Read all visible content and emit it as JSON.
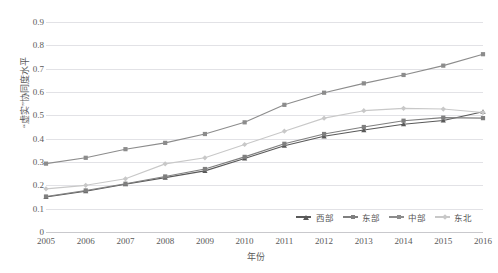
{
  "top_caption": "",
  "axes": {
    "y_title": "“虚实”协同度水平",
    "x_title": "年份",
    "y_ticks": [
      "0.9",
      "0.8",
      "0.7",
      "0.6",
      "0.5",
      "0.4",
      "0.3",
      "0.2",
      "0.1",
      "0"
    ],
    "x_ticks": [
      "2005",
      "2006",
      "2007",
      "2008",
      "2009",
      "2010",
      "2011",
      "2012",
      "2013",
      "2014",
      "2015",
      "2016"
    ]
  },
  "legend": {
    "position": "bottom-right",
    "items": [
      {
        "label": "西部",
        "color": "#595959",
        "marker": "triangle"
      },
      {
        "label": "东部",
        "color": "#7f7f7f",
        "marker": "square"
      },
      {
        "label": "中部",
        "color": "#8c8c8c",
        "marker": "square"
      },
      {
        "label": "东北",
        "color": "#c8c8c8",
        "marker": "diamond"
      }
    ]
  },
  "chart_data": {
    "type": "line",
    "title": "",
    "xlabel": "年份",
    "ylabel": "“虚实”协同度水平",
    "x": [
      2005,
      2006,
      2007,
      2008,
      2009,
      2010,
      2011,
      2012,
      2013,
      2014,
      2015,
      2016
    ],
    "ylim": [
      0,
      0.9
    ],
    "xlim": [
      2005,
      2016
    ],
    "grid": true,
    "series": [
      {
        "name": "西部",
        "color": "#595959",
        "marker": "triangle",
        "values": [
          0.15,
          0.175,
          0.205,
          0.233,
          0.262,
          0.315,
          0.37,
          0.41,
          0.437,
          0.462,
          0.478,
          0.515
        ]
      },
      {
        "name": "东部",
        "color": "#7f7f7f",
        "marker": "square",
        "values": [
          0.152,
          0.178,
          0.207,
          0.238,
          0.27,
          0.322,
          0.378,
          0.42,
          0.45,
          0.477,
          0.49,
          0.488
        ]
      },
      {
        "name": "中部",
        "color": "#8c8c8c",
        "marker": "square",
        "values": [
          0.293,
          0.318,
          0.355,
          0.382,
          0.42,
          0.47,
          0.545,
          0.597,
          0.637,
          0.673,
          0.713,
          0.762
        ]
      },
      {
        "name": "东北",
        "color": "#c8c8c8",
        "marker": "diamond",
        "values": [
          0.185,
          0.2,
          0.228,
          0.292,
          0.318,
          0.375,
          0.432,
          0.488,
          0.52,
          0.53,
          0.527,
          0.512
        ]
      }
    ]
  }
}
